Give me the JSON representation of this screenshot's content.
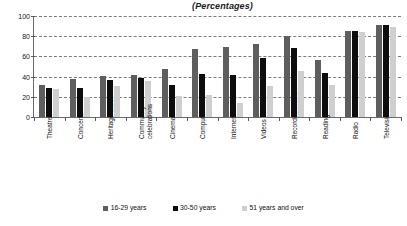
{
  "chart_data": {
    "type": "bar",
    "title": "(Percentages)",
    "xlabel": "",
    "ylabel": "",
    "ylim": [
      0,
      100
    ],
    "yticks": [
      0,
      20,
      40,
      60,
      80,
      100
    ],
    "grid": true,
    "legend_position": "bottom",
    "categories": [
      "Theatre",
      "Concerts",
      "Heritage sites",
      "Community celebrations",
      "Cinema",
      "Computer",
      "Internet",
      "Videos",
      "Recorded music",
      "Reading",
      "Radio",
      "Television"
    ],
    "series": [
      {
        "name": "16-29 years",
        "color": "#5e5e5e",
        "values": [
          32,
          38,
          41,
          42,
          48,
          67,
          69,
          72,
          80,
          56,
          85,
          91
        ]
      },
      {
        "name": "30-50 years",
        "color": "#0d0d0d",
        "values": [
          29,
          29,
          37,
          39,
          32,
          43,
          42,
          58,
          68,
          44,
          85,
          91
        ]
      },
      {
        "name": "51 years and over",
        "color": "#cfcfcf",
        "values": [
          28,
          20,
          31,
          36,
          21,
          22,
          14,
          31,
          46,
          32,
          84,
          89
        ]
      }
    ]
  }
}
